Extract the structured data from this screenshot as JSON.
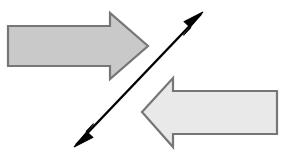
{
  "canvas": {
    "width": 291,
    "height": 165,
    "background": "#ffffff",
    "title": "Two opposing block arrows crossed by a double-headed diagonal arrow"
  },
  "palette": {
    "block_arrow_dark_fill": "#c9c9c9",
    "block_arrow_light_fill": "#e9e9e9",
    "block_arrow_stroke": "#767676",
    "diagonal_arrow_stroke": "#000000",
    "background": "#ffffff"
  },
  "shapes": {
    "right_arrow": {
      "label": "right-pointing block arrow",
      "direction": "right",
      "fill": "#c9c9c9",
      "stroke": "#767676",
      "stroke_width": 2.2,
      "points": "8,26 110,26 110,13 148,46 110,79 110,66 8,66",
      "shaft": {
        "x": 8,
        "y": 26,
        "width": 102,
        "height": 40
      },
      "head": {
        "tip_x": 148,
        "tip_y": 46,
        "base_x": 110,
        "top_y": 13,
        "bottom_y": 79
      }
    },
    "left_arrow": {
      "label": "left-pointing block arrow",
      "direction": "left",
      "fill": "#e9e9e9",
      "stroke": "#767676",
      "stroke_width": 2.2,
      "points": "142,112 173,78 173,91 277,91 277,134 173,134 173,147",
      "shaft": {
        "x": 173,
        "y": 91,
        "width": 104,
        "height": 43
      },
      "head": {
        "tip_x": 142,
        "tip_y": 112,
        "base_x": 173,
        "top_y": 78,
        "bottom_y": 147
      }
    },
    "diagonal_arrow": {
      "label": "double-headed diagonal arrow",
      "direction": "both",
      "stroke": "#000000",
      "stroke_width": 2.4,
      "start": {
        "x": 76,
        "y": 145
      },
      "end": {
        "x": 201,
        "y": 14
      },
      "head_length": 19,
      "head_half_width": 5.5,
      "upper_head_points": "203,12 183,22 190,28 184,36",
      "lower_head_points": "74,147 94,137 87,131 93,123"
    }
  },
  "legend": {
    "right_arrow_name": "right arrow",
    "left_arrow_name": "left arrow",
    "diagonal_arrow_name": "two-way diagonal arrow"
  }
}
